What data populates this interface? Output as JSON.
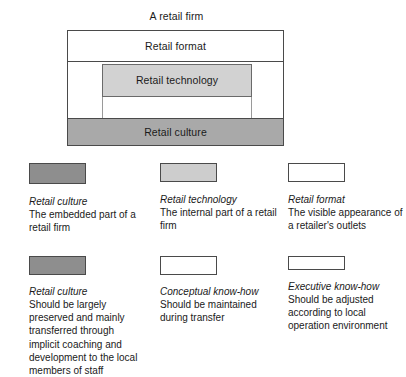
{
  "figure": {
    "title": "A retail firm",
    "layers": [
      {
        "name": "retail-format",
        "label": "Retail format",
        "fill": "dotted-white"
      },
      {
        "name": "retail-technology",
        "label": "Retail technology",
        "fill": "#d2d2d2"
      },
      {
        "name": "retail-culture",
        "label": "Retail culture",
        "fill": "#a9a9a9"
      }
    ]
  },
  "legend": {
    "row1": [
      {
        "swatch": "dark-gray-swatch",
        "swatch_color": "#8e8e8e",
        "term": "Retail culture",
        "description": "The embedded part of a retail firm"
      },
      {
        "swatch": "light-gray-swatch",
        "swatch_color": "#cdcdcd",
        "term": "Retail technology",
        "description": "The internal part of a retail firm"
      },
      {
        "swatch": "white-swatch",
        "swatch_color": "#ffffff",
        "term": "Retail format",
        "description": "The visible appearance of a retailer's outlets"
      }
    ],
    "row2": [
      {
        "swatch": "dark-gray-swatch",
        "swatch_color": "#8e8e8e",
        "term": "Retail culture",
        "description": "Should be largely preserved and mainly transferred through implicit coaching and development to the local members of staff"
      },
      {
        "swatch": "dotted-swatch",
        "swatch_color": "#ffffff",
        "term": "Conceptual know-how",
        "description": "Should be maintained during transfer"
      },
      {
        "swatch": "dotted-swatch",
        "swatch_color": "#ffffff",
        "term": "Executive know-how",
        "description": "Should be adjusted according to local operation environment"
      }
    ]
  }
}
